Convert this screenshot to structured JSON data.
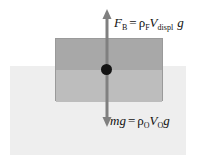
{
  "figure": {
    "type": "free-body-diagram"
  },
  "fluid": {
    "name": "fluid-region",
    "color": "#eeeeee"
  },
  "block": {
    "name": "submerged-object",
    "color_above_waterline": "#a8a8a8",
    "color_below_waterline": "#bdbdbd",
    "border_color": "#9a9a9a"
  },
  "center_of_mass": {
    "label": "center-of-mass-dot",
    "color": "#141414"
  },
  "arrows": {
    "color": "#808080",
    "buoyant": {
      "name": "buoyant-force-arrow",
      "direction": "up"
    },
    "weight": {
      "name": "weight-force-arrow",
      "direction": "down"
    }
  },
  "labels": {
    "buoyant": {
      "symbol": "F",
      "symbol_sub": "B",
      "equals": "=",
      "rho": "ρ",
      "rho_sub": "F",
      "volume": "V",
      "volume_sub": "displ",
      "gravity": "g"
    },
    "weight": {
      "mass": "m",
      "gravity_lhs": "g",
      "equals": "=",
      "rho": "ρ",
      "rho_sub": "O",
      "volume": "V",
      "volume_sub": "O",
      "gravity": "g"
    }
  }
}
